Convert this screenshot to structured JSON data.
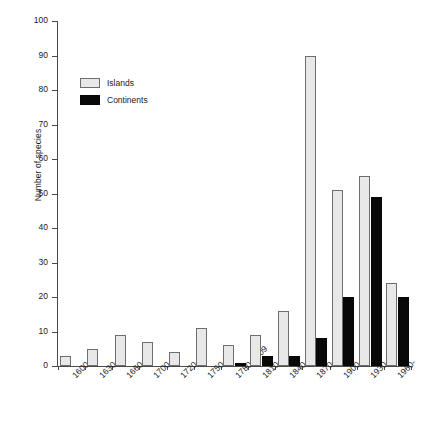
{
  "chart_data": {
    "type": "bar",
    "title": "",
    "xlabel": "",
    "ylabel": "Number of species",
    "ylim": [
      0,
      100
    ],
    "yticks": [
      0,
      10,
      20,
      30,
      40,
      50,
      60,
      70,
      80,
      90,
      100
    ],
    "grid": false,
    "legend_position": "upper-left-inside",
    "categories": [
      "1600-29",
      "1630-59",
      "1660-99",
      "1700-19",
      "1720-49",
      "1750-79",
      "1780-1809",
      "1810-39",
      "1840-69",
      "1870-99",
      "1900-29",
      "1930-59",
      "1960-"
    ],
    "series": [
      {
        "name": "Islands",
        "color": "#e8e8e8",
        "values": [
          3,
          5,
          9,
          7,
          4,
          11,
          6,
          9,
          16,
          90,
          51,
          55,
          24
        ]
      },
      {
        "name": "Continents",
        "color": "#090909",
        "values": [
          0,
          0,
          0,
          0,
          0,
          0,
          1,
          3,
          3,
          8,
          20,
          49,
          20
        ]
      }
    ]
  },
  "legend": {
    "items": [
      {
        "label": "Islands"
      },
      {
        "label": "Continents"
      }
    ]
  },
  "axes": {
    "y_title": "Number of species"
  }
}
